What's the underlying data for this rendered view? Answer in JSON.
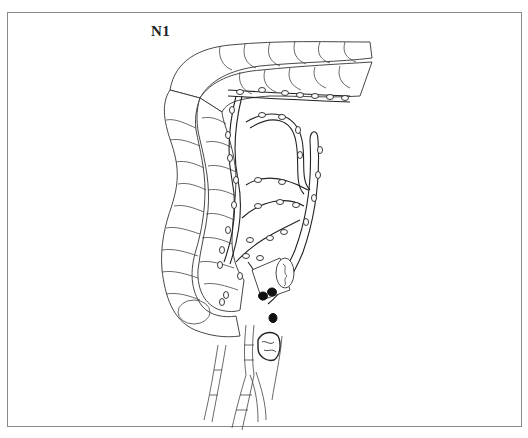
{
  "figure": {
    "label": "N1",
    "colors": {
      "frame": "#8a8a8a",
      "line": "#333333",
      "involved_node": "#111111",
      "background": "#ffffff"
    }
  }
}
